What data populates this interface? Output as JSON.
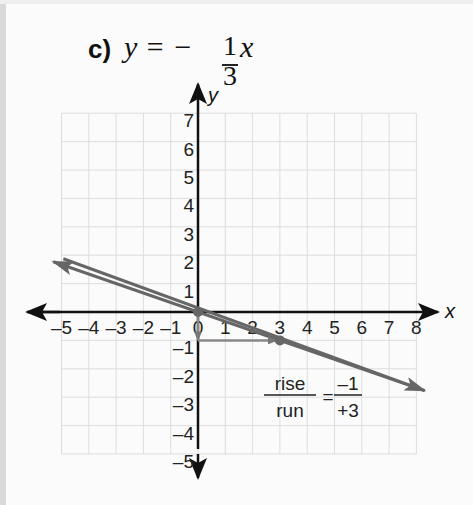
{
  "problem": {
    "label": "c)",
    "equation_lhs": "y = −",
    "slope_numerator": "1",
    "slope_denominator": "3",
    "variable": "x"
  },
  "axes": {
    "x_label": "x",
    "y_label": "y",
    "x_ticks": [
      "–5",
      "–4",
      "–3",
      "–2",
      "–1",
      "0",
      "1",
      "2",
      "3",
      "4",
      "5",
      "6",
      "7",
      "8"
    ],
    "y_ticks": [
      "7",
      "6",
      "5",
      "4",
      "3",
      "2",
      "1",
      "–1",
      "–2",
      "–3",
      "–4",
      "–5"
    ]
  },
  "annotation": {
    "rise": "rise",
    "run": "run",
    "equals": "=",
    "rise_value": "–1",
    "run_value": "+3"
  },
  "chart_data": {
    "type": "line",
    "xlabel": "x",
    "ylabel": "y",
    "xlim": [
      -5,
      8
    ],
    "ylim": [
      -5,
      7
    ],
    "grid": true,
    "series": [
      {
        "name": "y = -1/3 x",
        "x": [
          -5.3,
          8.3
        ],
        "y": [
          1.77,
          -2.77
        ]
      }
    ],
    "points": [
      {
        "x": 0,
        "y": 0
      },
      {
        "x": 3,
        "y": -1
      }
    ],
    "annotations": [
      {
        "type": "arrow",
        "from": [
          0,
          0
        ],
        "to": [
          0,
          -1
        ],
        "label": "rise = -1"
      },
      {
        "type": "arrow",
        "from": [
          0,
          -1
        ],
        "to": [
          3,
          -1
        ],
        "label": "run = +3"
      },
      {
        "text": "rise/run = -1/+3",
        "x": 3.5,
        "y": -3
      }
    ],
    "colors": {
      "line": "#666666",
      "axes": "#111111",
      "grid": "#dddddd"
    }
  }
}
